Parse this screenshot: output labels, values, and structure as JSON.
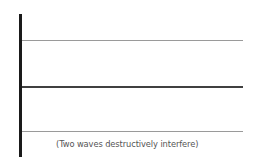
{
  "diagram": {
    "caption": "(Two waves destructively interfere)",
    "lines": [
      {
        "position": "top",
        "color": "#9a9a9a"
      },
      {
        "position": "middle",
        "color": "#404040"
      },
      {
        "position": "bottom",
        "color": "#9a9a9a"
      }
    ],
    "wall_color": "#1a1a1a"
  }
}
